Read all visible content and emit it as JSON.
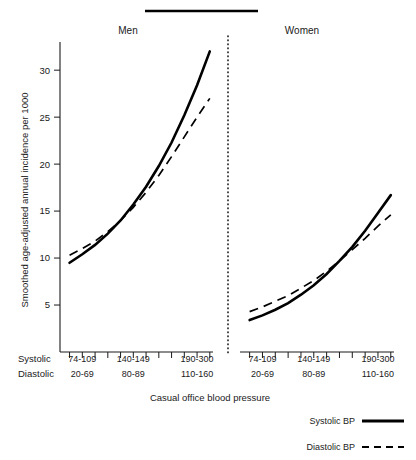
{
  "figure": {
    "title_bar": "",
    "y_axis_title": "Smoothed age-adjusted annual incidence per 1000",
    "x_axis_title": "Casual office blood pressure",
    "row_label_systolic": "Systolic",
    "row_label_diastolic": "Diastolic",
    "panel_men": "Men",
    "panel_women": "Women"
  },
  "legend": {
    "systolic_label": "Systolic BP",
    "diastolic_label": "Diastolic BP"
  },
  "y_ticks": [
    "5",
    "10",
    "15",
    "20",
    "25",
    "30"
  ],
  "x_category_labels": {
    "systolic": [
      "74-109",
      "140-149",
      "190-300"
    ],
    "diastolic": [
      "20-69",
      "80-89",
      "110-160"
    ]
  },
  "chart_data": {
    "type": "line",
    "xlabel": "Casual office blood pressure",
    "ylabel": "Smoothed age-adjusted annual incidence per 1000",
    "ylim": [
      0,
      33
    ],
    "yticks": [
      5,
      10,
      15,
      20,
      25,
      30
    ],
    "grid": false,
    "legend_position": "bottom-right",
    "x_tick_count_per_panel": 12,
    "x_labeled_categories_systolic": [
      "74-109",
      "140-149",
      "190-300"
    ],
    "x_labeled_categories_diastolic": [
      "20-69",
      "80-89",
      "110-160"
    ],
    "x_labeled_tick_indices": [
      1,
      5,
      10
    ],
    "panels": [
      {
        "name": "Men",
        "series": [
          {
            "name": "Systolic BP",
            "style": "solid",
            "x": [
              0,
              1,
              2,
              3,
              4,
              5,
              6,
              7,
              8,
              9,
              10,
              11
            ],
            "values": [
              9.5,
              10.4,
              11.4,
              12.6,
              14.0,
              15.7,
              17.6,
              19.8,
              22.3,
              25.2,
              28.4,
              32.0
            ]
          },
          {
            "name": "Diastolic BP",
            "style": "dashed",
            "x": [
              0,
              1,
              2,
              3,
              4,
              5,
              6,
              7,
              8,
              9,
              10,
              11
            ],
            "values": [
              10.3,
              11.0,
              11.8,
              12.8,
              14.0,
              15.4,
              17.0,
              18.8,
              20.8,
              22.9,
              25.0,
              27.0
            ]
          }
        ]
      },
      {
        "name": "Women",
        "series": [
          {
            "name": "Systolic BP",
            "style": "solid",
            "x": [
              0,
              1,
              2,
              3,
              4,
              5,
              6,
              7,
              8,
              9,
              10,
              11
            ],
            "values": [
              3.4,
              3.9,
              4.5,
              5.2,
              6.1,
              7.1,
              8.3,
              9.7,
              11.2,
              12.9,
              14.8,
              16.7
            ]
          },
          {
            "name": "Diastolic BP",
            "style": "dashed",
            "x": [
              0,
              1,
              2,
              3,
              4,
              5,
              6,
              7,
              8,
              9,
              10,
              11
            ],
            "values": [
              4.3,
              4.8,
              5.4,
              6.0,
              6.8,
              7.6,
              8.6,
              9.7,
              10.9,
              12.1,
              13.4,
              14.6
            ]
          }
        ]
      }
    ]
  }
}
